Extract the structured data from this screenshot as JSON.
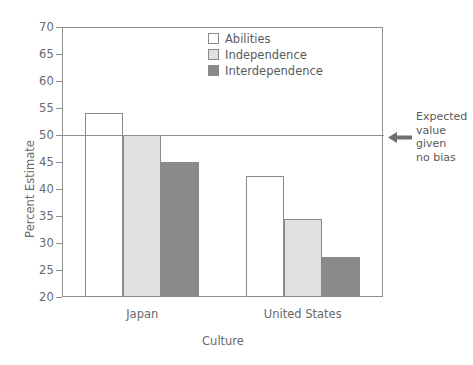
{
  "chart_data": {
    "type": "bar",
    "title": "",
    "xlabel": "Culture",
    "ylabel": "Percent Estimate",
    "categories": [
      "Japan",
      "United States"
    ],
    "series": [
      {
        "name": "Abilities",
        "values": [
          54.0,
          42.5
        ],
        "color": "#ffffff"
      },
      {
        "name": "Independence",
        "values": [
          50.0,
          34.5
        ],
        "color": "#e0e0e0"
      },
      {
        "name": "Interdependence",
        "values": [
          45.0,
          27.5
        ],
        "color": "#8a8a8a"
      }
    ],
    "ylim": [
      20,
      70
    ],
    "yticks": [
      20,
      25,
      30,
      35,
      40,
      45,
      50,
      55,
      60,
      65,
      70
    ],
    "grid": false,
    "legend_position": "top-center",
    "reference_line": {
      "value": 50,
      "annotation": "Expected\nvalue\ngiven\nno bias",
      "annotation_lines": [
        "Expected",
        "value",
        "given",
        "no bias"
      ],
      "arrow": "left-arrow"
    }
  },
  "axes": {
    "y_title": "Percent Estimate",
    "x_title": "Culture",
    "y_tick_labels": [
      "70",
      "65",
      "60",
      "55",
      "50",
      "45",
      "40",
      "35",
      "30",
      "25",
      "20"
    ],
    "x_tick_labels": [
      "Japan",
      "United States"
    ]
  },
  "legend": {
    "items": [
      {
        "label": "Abilities"
      },
      {
        "label": "Independence"
      },
      {
        "label": "Interdependence"
      }
    ]
  },
  "annotation": {
    "line1": "Expected",
    "line2": "value",
    "line3": "given",
    "line4": "no bias"
  },
  "caption": {
    "text": ""
  }
}
